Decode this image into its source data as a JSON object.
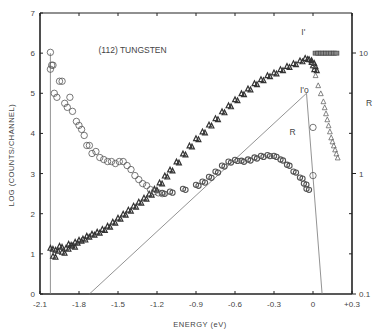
{
  "chart_data": {
    "type": "scatter",
    "title": "(112) TUNGSTEN",
    "xlabel": "ENERGY (eV)",
    "ylabel": "LOG (COUNTS/CHANNEL)",
    "y2label": "R",
    "xlim": [
      -2.1,
      0.3
    ],
    "ylim": [
      0,
      7
    ],
    "y2lim": [
      0.1,
      10
    ],
    "y2scale": "log",
    "grid": false,
    "xticks": [
      "-2.1",
      "-1.8",
      "-1.5",
      "-1.2",
      "-0.9",
      "-0.6",
      "-0.3",
      "0",
      "+0.3"
    ],
    "xtick_values": [
      -2.1,
      -1.8,
      -1.5,
      -1.2,
      -0.9,
      -0.6,
      -0.3,
      0,
      0.3
    ],
    "yticks": [
      "0",
      "1",
      "2",
      "3",
      "4",
      "5",
      "6",
      "7"
    ],
    "ytick_values": [
      0,
      1,
      2,
      3,
      4,
      5,
      6,
      7
    ],
    "y2ticks": [
      "0.1",
      "1",
      "10"
    ],
    "y2tick_values": [
      0.1,
      1,
      10
    ],
    "annotations": [
      {
        "text": "(112) TUNGSTEN",
        "x": -1.65,
        "y": 6.0
      },
      {
        "text": "I'",
        "x": -0.09,
        "y": 6.45
      },
      {
        "text": "I'o",
        "x": -0.1,
        "y": 5.0
      },
      {
        "text": "R",
        "x": -0.18,
        "y": 3.95
      }
    ],
    "series": [
      {
        "name": "I'",
        "marker": "triangle",
        "x": [
          -2.02,
          -2.0,
          -1.98,
          -1.95,
          -1.93,
          -1.9,
          -1.88,
          -1.85,
          -1.83,
          -1.8,
          -1.77,
          -1.74,
          -1.7,
          -1.66,
          -1.62,
          -1.58,
          -1.54,
          -1.5,
          -1.46,
          -1.42,
          -1.38,
          -1.34,
          -1.3,
          -1.26,
          -1.22,
          -1.18,
          -1.14,
          -1.1,
          -1.05,
          -1.0,
          -0.95,
          -0.9,
          -0.85,
          -0.8,
          -0.75,
          -0.7,
          -0.65,
          -0.6,
          -0.55,
          -0.5,
          -0.45,
          -0.4,
          -0.35,
          -0.3,
          -0.25,
          -0.2,
          -0.15,
          -0.1,
          -0.06,
          -0.03,
          -0.01,
          0.0,
          0.01
        ],
        "values": [
          1.15,
          0.95,
          1.1,
          1.2,
          1.05,
          1.15,
          1.25,
          1.2,
          1.3,
          1.35,
          1.38,
          1.45,
          1.5,
          1.55,
          1.62,
          1.7,
          1.8,
          1.9,
          2.0,
          2.1,
          2.2,
          2.3,
          2.4,
          2.5,
          2.62,
          2.78,
          2.95,
          3.1,
          3.3,
          3.5,
          3.7,
          3.88,
          4.05,
          4.22,
          4.38,
          4.55,
          4.7,
          4.85,
          5.0,
          5.12,
          5.25,
          5.35,
          5.45,
          5.52,
          5.6,
          5.68,
          5.75,
          5.82,
          5.88,
          5.85,
          5.78,
          5.7,
          5.6
        ]
      },
      {
        "name": "R (circles, left)",
        "marker": "circle",
        "x": [
          -2.02,
          -2.0,
          -1.99,
          -1.97,
          -1.95,
          -1.93,
          -1.91,
          -1.89,
          -1.87,
          -1.85,
          -1.82,
          -1.8,
          -1.78,
          -1.76,
          -1.74,
          -1.72,
          -1.7,
          -1.67,
          -1.64,
          -1.61,
          -1.58,
          -1.55,
          -1.52,
          -1.49,
          -1.46,
          -1.43,
          -1.4,
          -1.37,
          -1.34,
          -1.31,
          -1.28,
          -1.25,
          -1.22,
          -1.19,
          -1.16
        ],
        "values": [
          5.6,
          5.7,
          5.0,
          4.9,
          5.3,
          5.3,
          4.75,
          4.65,
          4.9,
          4.55,
          4.3,
          4.2,
          4.1,
          3.95,
          3.7,
          3.7,
          3.5,
          3.55,
          3.4,
          3.35,
          3.3,
          3.3,
          3.25,
          3.3,
          3.3,
          3.2,
          3.1,
          2.95,
          2.85,
          2.75,
          2.7,
          2.6,
          2.55,
          2.52,
          2.5
        ]
      },
      {
        "name": "R (thick, left)",
        "marker": "circle",
        "x": [
          -1.16,
          -1.1,
          -1.0,
          -0.9,
          -0.85,
          -0.8,
          -0.75,
          -0.7,
          -0.65,
          -0.6,
          -0.55,
          -0.5,
          -0.45,
          -0.4,
          -0.35,
          -0.3,
          -0.25,
          -0.2,
          -0.15,
          -0.1,
          -0.07,
          -0.05
        ],
        "values": [
          2.52,
          2.55,
          2.62,
          2.72,
          2.8,
          2.92,
          3.05,
          3.2,
          3.3,
          3.34,
          3.32,
          3.35,
          3.4,
          3.44,
          3.46,
          3.44,
          3.35,
          3.22,
          3.05,
          2.9,
          2.75,
          2.62
        ]
      },
      {
        "name": "Right tail triangles",
        "marker": "triangle",
        "x": [
          0.0,
          0.02,
          0.04,
          0.06,
          0.08,
          0.09,
          0.1,
          0.11,
          0.12,
          0.13,
          0.14,
          0.15,
          0.16,
          0.17,
          0.18,
          0.19
        ],
        "values": [
          5.7,
          5.45,
          5.2,
          5.0,
          4.8,
          4.65,
          4.5,
          4.35,
          4.2,
          4.05,
          3.9,
          3.8,
          3.7,
          3.6,
          3.5,
          3.4
        ]
      },
      {
        "name": "Plateau",
        "marker": "square",
        "x": [
          0.02,
          0.04,
          0.06,
          0.08,
          0.1,
          0.12,
          0.14,
          0.16,
          0.18
        ],
        "values": [
          6.0,
          6.0,
          6.0,
          6.0,
          6.0,
          6.0,
          6.0,
          6.0,
          6.0
        ]
      },
      {
        "name": "Left edge markers",
        "marker": "circle",
        "x": [
          -2.02,
          -2.01,
          0.0,
          0.0
        ],
        "values": [
          6.02,
          5.7,
          4.15,
          2.95
        ]
      }
    ],
    "lines": [
      {
        "name": "I'o",
        "x": [
          -1.72,
          -0.05,
          0.07
        ],
        "values": [
          0,
          5.0,
          0
        ]
      },
      {
        "name": "cutoff-left",
        "x": [
          -2.02,
          -2.02
        ],
        "values": [
          6.0,
          0
        ]
      }
    ]
  }
}
